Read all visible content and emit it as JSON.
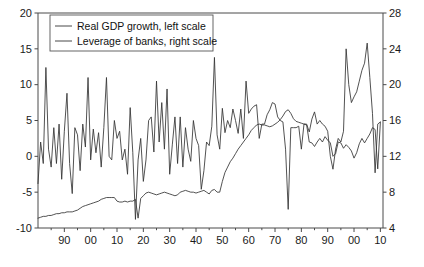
{
  "chart_data": {
    "type": "line",
    "title": "",
    "subtitle": "",
    "xlabel": "",
    "ylabel": "",
    "y2label": "",
    "grid": false,
    "legend_position": "top-left",
    "xlim": [
      1880,
      2011
    ],
    "ylim": [
      -10,
      20
    ],
    "y2lim": [
      4,
      28
    ],
    "left_ticks": [
      "20",
      "15",
      "10",
      "5",
      "0",
      "-5",
      "-10"
    ],
    "left_tick_values": [
      20,
      15,
      10,
      5,
      0,
      -5,
      -10
    ],
    "right_ticks": [
      "28",
      "24",
      "20",
      "16",
      "12",
      "8",
      "4"
    ],
    "right_tick_values": [
      28,
      24,
      20,
      16,
      12,
      8,
      4
    ],
    "x_ticks": [
      "90",
      "00",
      "10",
      "20",
      "30",
      "40",
      "50",
      "60",
      "70",
      "80",
      "90",
      "00",
      "10"
    ],
    "x_tick_values": [
      1890,
      1900,
      1910,
      1920,
      1930,
      1940,
      1950,
      1960,
      1970,
      1980,
      1990,
      2000,
      2010
    ],
    "series": [
      {
        "name": "Real GDP growth, left scale",
        "axis": "left",
        "color": "#333333",
        "x": [
          1880,
          1881,
          1882,
          1883,
          1884,
          1885,
          1886,
          1887,
          1888,
          1889,
          1890,
          1891,
          1892,
          1893,
          1894,
          1895,
          1896,
          1897,
          1898,
          1899,
          1900,
          1901,
          1902,
          1903,
          1904,
          1905,
          1906,
          1907,
          1908,
          1909,
          1910,
          1911,
          1912,
          1913,
          1914,
          1915,
          1916,
          1917,
          1918,
          1919,
          1920,
          1921,
          1922,
          1923,
          1924,
          1925,
          1926,
          1927,
          1928,
          1929,
          1930,
          1931,
          1932,
          1933,
          1934,
          1935,
          1936,
          1937,
          1938,
          1939,
          1940,
          1941,
          1942,
          1943,
          1944,
          1945,
          1946,
          1947,
          1948,
          1949,
          1950,
          1951,
          1952,
          1953,
          1954,
          1955,
          1956,
          1957,
          1958,
          1959,
          1960,
          1961,
          1962,
          1963,
          1964,
          1965,
          1966,
          1967,
          1968,
          1969,
          1970,
          1971,
          1972,
          1973,
          1974,
          1975,
          1976,
          1977,
          1978,
          1979,
          1980,
          1981,
          1982,
          1983,
          1984,
          1985,
          1986,
          1987,
          1988,
          1989,
          1990,
          1991,
          1992,
          1993,
          1994,
          1995,
          1996,
          1997,
          1998,
          1999,
          2000,
          2001,
          2002,
          2003,
          2004,
          2005,
          2006,
          2007,
          2008,
          2009,
          2010
        ],
        "values": [
          -3.8,
          2.0,
          -1.0,
          12.4,
          1.0,
          -1.5,
          4.0,
          -1.0,
          4.5,
          -3.2,
          3.5,
          8.8,
          -1.0,
          -5.2,
          4.0,
          3.0,
          -2.0,
          4.5,
          1.3,
          11.0,
          -0.5,
          3.8,
          0.5,
          3.3,
          -1.5,
          4.0,
          11.0,
          0.0,
          -0.5,
          5.0,
          2.5,
          3.5,
          -0.5,
          1.0,
          -2.5,
          6.8,
          0.5,
          -8.8,
          -0.5,
          2.5,
          -3.5,
          -0.5,
          5.0,
          5.5,
          0.6,
          10.5,
          2.0,
          7.5,
          1.0,
          9.4,
          -2.5,
          1.6,
          5.5,
          -1.0,
          5.5,
          -1.5,
          4.0,
          1.0,
          -0.7,
          5.0,
          2.5,
          1.5,
          -4.6,
          -2.0,
          2.0,
          1.5,
          4.2,
          13.8,
          3.0,
          1.0,
          6.7,
          3.3,
          5.0,
          4.0,
          6.6,
          5.0,
          3.2,
          6.6,
          2.5,
          10.5,
          6.0,
          6.6,
          7.0,
          7.2,
          2.5,
          4.5,
          4.5,
          5.8,
          6.5,
          7.5,
          7.3,
          5.5,
          5.0,
          4.8,
          1.0,
          -7.4,
          4.0,
          4.0,
          4.0,
          4.2,
          1.0,
          4.5,
          4.5,
          3.4,
          5.2,
          6.2,
          4.5,
          5.0,
          4.5,
          4.2,
          3.5,
          0.0,
          -1.8,
          1.0,
          2.5,
          2.0,
          3.5,
          15.0,
          10.0,
          7.5,
          8.3,
          9.0,
          10.5,
          12.0,
          13.0,
          15.8,
          11.0,
          6.0,
          -2.3,
          4.5,
          4.8
        ]
      },
      {
        "name": "Leverage of banks, right scale",
        "axis": "right",
        "color": "#333333",
        "x": [
          1880,
          1881,
          1882,
          1883,
          1884,
          1885,
          1886,
          1887,
          1888,
          1889,
          1890,
          1891,
          1892,
          1893,
          1894,
          1895,
          1896,
          1897,
          1898,
          1899,
          1900,
          1901,
          1902,
          1903,
          1904,
          1905,
          1906,
          1907,
          1908,
          1909,
          1910,
          1911,
          1912,
          1913,
          1914,
          1915,
          1916,
          1917,
          1918,
          1919,
          1920,
          1921,
          1922,
          1923,
          1924,
          1925,
          1926,
          1927,
          1928,
          1929,
          1930,
          1931,
          1932,
          1933,
          1934,
          1935,
          1936,
          1937,
          1938,
          1939,
          1940,
          1941,
          1942,
          1943,
          1944,
          1945,
          1946,
          1947,
          1948,
          1949,
          1950,
          1951,
          1952,
          1953,
          1954,
          1955,
          1956,
          1957,
          1958,
          1959,
          1960,
          1961,
          1962,
          1963,
          1964,
          1965,
          1966,
          1967,
          1968,
          1969,
          1970,
          1971,
          1972,
          1973,
          1974,
          1975,
          1976,
          1977,
          1978,
          1979,
          1980,
          1981,
          1982,
          1983,
          1984,
          1985,
          1986,
          1987,
          1988,
          1989,
          1990,
          1991,
          1992,
          1993,
          1994,
          1995,
          1996,
          1997,
          1998,
          1999,
          2000,
          2001,
          2002,
          2003,
          2004,
          2005,
          2006,
          2007,
          2008,
          2009,
          2010
        ],
        "values": [
          5.1,
          5.2,
          5.3,
          5.3,
          5.4,
          5.4,
          5.5,
          5.6,
          5.6,
          5.7,
          5.7,
          5.8,
          5.8,
          5.8,
          5.9,
          6.0,
          6.2,
          6.4,
          6.5,
          6.6,
          6.7,
          6.8,
          6.9,
          7.0,
          7.2,
          7.3,
          7.4,
          7.4,
          7.4,
          7.4,
          7.0,
          6.9,
          6.9,
          7.0,
          6.9,
          7.0,
          7.0,
          7.2,
          5.1,
          7.3,
          7.6,
          7.9,
          8.0,
          7.9,
          7.8,
          7.7,
          7.8,
          7.9,
          8.0,
          7.9,
          7.8,
          7.7,
          7.6,
          7.7,
          8.0,
          8.1,
          8.2,
          8.1,
          8.0,
          8.0,
          7.9,
          8.0,
          8.1,
          8.2,
          8.0,
          7.8,
          8.2,
          8.3,
          8.0,
          8.0,
          9.2,
          10.2,
          10.8,
          11.4,
          11.8,
          12.3,
          12.8,
          13.2,
          13.6,
          14.0,
          14.4,
          14.9,
          15.2,
          15.5,
          15.6,
          15.5,
          15.5,
          15.4,
          15.3,
          15.4,
          15.6,
          15.8,
          16.1,
          16.5,
          17.0,
          17.2,
          16.8,
          16.2,
          15.9,
          15.8,
          15.7,
          15.6,
          15.5,
          13.6,
          13.5,
          13.1,
          13.6,
          14.0,
          13.6,
          14.2,
          13.8,
          13.5,
          12.0,
          12.3,
          13.6,
          13.5,
          12.9,
          13.3,
          13.0,
          12.6,
          11.8,
          12.4,
          13.4,
          14.0,
          13.5,
          14.0,
          14.5,
          15.2,
          15.0,
          10.6,
          15.8
        ]
      }
    ]
  },
  "legend": {
    "items": [
      {
        "label": "Real GDP growth, left scale"
      },
      {
        "label": "Leverage of banks, right scale"
      }
    ]
  }
}
